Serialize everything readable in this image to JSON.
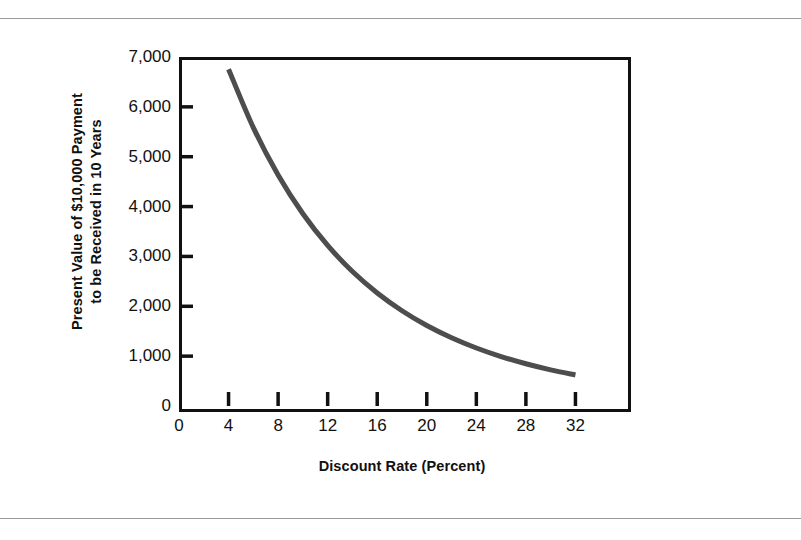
{
  "figure": {
    "y_axis_title_line1": "Present Value of $10,000 Payment",
    "y_axis_title_line2": "to be Received in 10 Years",
    "x_axis_title": "Discount Rate (Percent)",
    "frame_color": "#111111",
    "curve_color": "#4d4d4d",
    "rule_color": "#9a9a9a",
    "background": "#ffffff"
  },
  "chart_data": {
    "type": "line",
    "title": "",
    "subtitle": "",
    "xlabel": "Discount Rate (Percent)",
    "ylabel": "Present Value of $10,000 Payment to be Received in 10 Years",
    "xlim": [
      0,
      36
    ],
    "ylim": [
      0,
      7000
    ],
    "grid": false,
    "legend": "none",
    "xticks": [
      0,
      4,
      8,
      12,
      16,
      20,
      24,
      28,
      32
    ],
    "xtick_labels": [
      "0",
      "4",
      "8",
      "12",
      "16",
      "20",
      "24",
      "28",
      "32"
    ],
    "yticks": [
      0,
      1000,
      2000,
      3000,
      4000,
      5000,
      6000,
      7000
    ],
    "ytick_labels": [
      "0",
      "1,000",
      "2,000",
      "3,000",
      "4,000",
      "5,000",
      "6,000",
      "7,000"
    ],
    "series": [
      {
        "name": "Present Value of $10,000 in 10 Years",
        "color": "#4d4d4d",
        "line_width": 5,
        "x": [
          4,
          6,
          8,
          10,
          12,
          14,
          16,
          18,
          20,
          22,
          24,
          26,
          28,
          30,
          32
        ],
        "y": [
          6756,
          5584,
          4632,
          3855,
          3220,
          2697,
          2267,
          1911,
          1615,
          1369,
          1164,
          992,
          847,
          725,
          623
        ]
      }
    ],
    "annotations": []
  }
}
